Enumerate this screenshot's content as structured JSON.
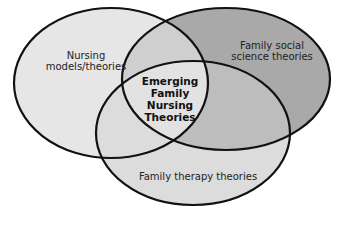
{
  "diagram": {
    "type": "venn",
    "sets": [
      {
        "id": "nursing",
        "label_lines": [
          "Nursing",
          "models/theories"
        ],
        "fill": "#e6e6e6"
      },
      {
        "id": "social",
        "label_lines": [
          "Family social",
          "science theories"
        ],
        "fill": "#a9a9a9"
      },
      {
        "id": "therapy",
        "label_lines": [
          "Family therapy theories"
        ],
        "fill": "#d9d9d9"
      }
    ],
    "center": {
      "label_lines": [
        "Emerging",
        "Family",
        "Nursing",
        "Theories"
      ]
    },
    "colors": {
      "stroke": "#111111",
      "overlap_social_therapy": "#bdbdbd",
      "overlap_nursing_social": "#cfcfcf",
      "center": "#e0e0e0"
    }
  }
}
